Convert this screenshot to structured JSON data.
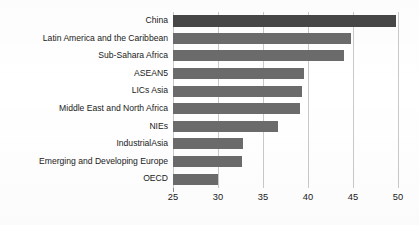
{
  "chart_data": {
    "type": "bar",
    "orientation": "horizontal",
    "title": "",
    "subtitle": "",
    "xlabel": "",
    "ylabel": "",
    "categories": [
      "China",
      "Latin America and the Caribbean",
      "Sub-Sahara Africa",
      "ASEAN5",
      "LICs Asia",
      "Middle East and North Africa",
      "NIEs",
      "IndustrialAsia",
      "Emerging and Developing Europe",
      "OECD"
    ],
    "values": [
      49.8,
      44.8,
      44.0,
      39.6,
      39.3,
      39.1,
      36.7,
      32.8,
      32.7,
      30.0
    ],
    "xlim": [
      25,
      50
    ],
    "xticks": [
      25,
      30,
      35,
      40,
      45,
      50
    ],
    "xtick_labels": [
      "25",
      "30",
      "35",
      "40",
      "45",
      "50"
    ],
    "grid": "vertical",
    "legend": "none",
    "series": [
      {
        "name": "",
        "values": [
          49.8,
          44.8,
          44.0,
          39.6,
          39.3,
          39.1,
          36.7,
          32.8,
          32.7,
          30.0
        ]
      }
    ],
    "colors": {
      "bar_default": "#6b6b6b",
      "bar_highlight": "#474747",
      "gridline": "#c9c9c9",
      "axis": "#8a8a8a",
      "text": "#1a1a1a",
      "background": "#ffffff"
    },
    "highlighted_categories": [
      "China"
    ],
    "annotations": []
  }
}
